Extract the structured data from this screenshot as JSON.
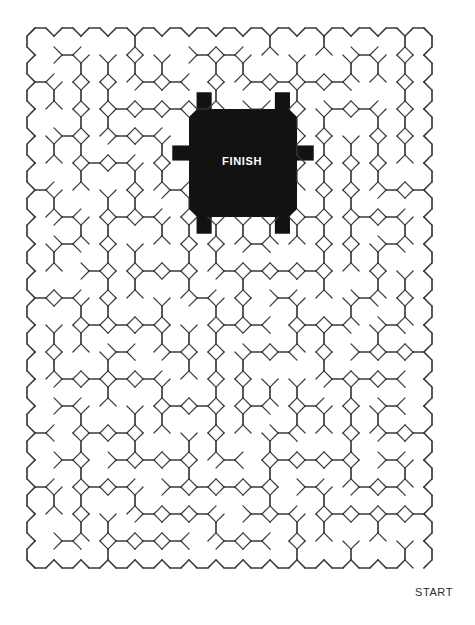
{
  "page": {
    "background_color": "#ffffff",
    "width": 475,
    "height": 625
  },
  "maze": {
    "type": "octagonal-grid-maze",
    "wall_color": "#3a3a3a",
    "wall_width": 1.2,
    "cell_pitch": 27,
    "bounds": {
      "x": 27,
      "y": 28,
      "width": 419,
      "height": 553
    },
    "columns": 15,
    "rows": 20,
    "entrance": {
      "name": "start",
      "position": "bottom-right"
    },
    "goal": {
      "name": "finish",
      "position": "top-center"
    }
  },
  "labels": {
    "start": "START",
    "finish": "FINISH",
    "artifact_a": ".",
    "artifact_b": "."
  },
  "finish_region": {
    "fill_color": "#121212",
    "x": 188,
    "y": 106,
    "width": 108,
    "height": 120,
    "text_color": "#ffffff"
  },
  "chart_data": {
    "type": "table",
    "categories": [
      "start",
      "finish"
    ],
    "values": [
      1,
      1
    ]
  }
}
